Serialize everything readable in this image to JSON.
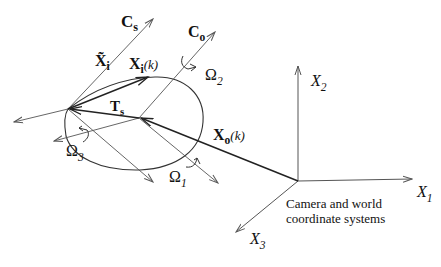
{
  "diagram": {
    "labels": {
      "cs": {
        "main": "C",
        "sub": "s"
      },
      "co": {
        "main": "C",
        "sub": "o"
      },
      "xi_tilde": {
        "main": "X̃",
        "sub": "i"
      },
      "xi_k": {
        "main": "X",
        "sub": "i",
        "arg": "(k)"
      },
      "ts": {
        "main": "T",
        "sub": "s"
      },
      "xo_k": {
        "main": "X",
        "sub": "o",
        "arg": "(k)"
      },
      "omega1": {
        "main": "Ω",
        "sub": "1"
      },
      "omega2": {
        "main": "Ω",
        "sub": "2"
      },
      "omega3": {
        "main": "Ω",
        "sub": "3"
      },
      "x1": {
        "main": "X",
        "sub": "1"
      },
      "x2": {
        "main": "X",
        "sub": "2"
      },
      "x3": {
        "main": "X",
        "sub": "3"
      }
    },
    "caption": [
      "Camera and world",
      "coordinate systems"
    ],
    "colors": {
      "heavy_line": "#222222",
      "thin_line": "#555555",
      "text": "#111111"
    }
  }
}
